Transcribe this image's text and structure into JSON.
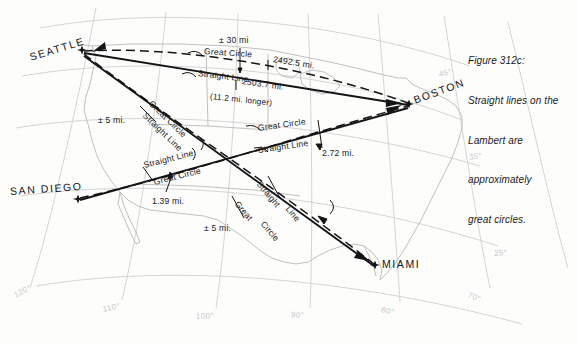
{
  "figure": {
    "caption_lines": [
      "Figure 312c:",
      "Straight lines on the",
      "Lambert are",
      "approximately",
      "great circles."
    ]
  },
  "cities": [
    {
      "name": "SEATTLE",
      "x": 30,
      "y": 60,
      "rot": -17,
      "marker_x": 82,
      "marker_y": 50
    },
    {
      "name": "BOSTON",
      "x": 412,
      "y": 101,
      "rot": -20,
      "marker_x": 409,
      "marker_y": 104
    },
    {
      "name": "SAN DIEGO",
      "x": 12,
      "y": 190,
      "rot": -4,
      "marker_x": 78,
      "marker_y": 199
    },
    {
      "name": "MIAMI",
      "x": 381,
      "y": 260,
      "rot": 0,
      "marker_x": 375,
      "marker_y": 265
    }
  ],
  "route_labels": {
    "seattle_boston": {
      "great_circle": "Great Circle",
      "straight_line": "Straight Line",
      "deviation": "± 30 mi",
      "gc_distance": "2492.5 mi.",
      "sl_distance": "2503.7 mi.",
      "difference": "(11.2 mi. longer)"
    },
    "sandiego_boston": {
      "great_circle": "Great Circle",
      "straight_line": "Straight Line",
      "deviation": "2.72 mi."
    },
    "sandiego_seattle_mid": {
      "great_circle": "Great Circle",
      "straight_line": "Straight Line",
      "deviation": "1.39 mi."
    },
    "seattle_miami_upper": {
      "great_circle": "Great Circle",
      "straight_line": "Straight Line",
      "deviation": "± 5 mi."
    },
    "seattle_miami_lower": {
      "straight_line_w1": "Straight",
      "straight_line_w2": "Line",
      "great_circle_w1": "Great",
      "great_circle_w2": "Circle",
      "deviation": "± 5 mi."
    }
  },
  "graticule": {
    "longitudes": [
      {
        "label": "120°",
        "x": 15,
        "y": 292,
        "rot": -28
      },
      {
        "label": "110°",
        "x": 103,
        "y": 306,
        "rot": -12
      },
      {
        "label": "100°",
        "x": 196,
        "y": 313,
        "rot": -2
      },
      {
        "label": "90°",
        "x": 291,
        "y": 311,
        "rot": 5
      },
      {
        "label": "80°",
        "x": 381,
        "y": 306,
        "rot": 12
      },
      {
        "label": "70°",
        "x": 468,
        "y": 291,
        "rot": 22
      }
    ],
    "latitudes": [
      {
        "label": "45°",
        "x": 439,
        "y": 71,
        "rot": -14
      },
      {
        "label": "35°",
        "x": 469,
        "y": 154,
        "rot": -8
      },
      {
        "label": "25°",
        "x": 494,
        "y": 250,
        "rot": -5
      }
    ]
  },
  "colors": {
    "ink": "#1a1a1a",
    "graticule": "#cfcfcf",
    "coast": "#b9b9b9",
    "background": "#fdfdfc"
  }
}
